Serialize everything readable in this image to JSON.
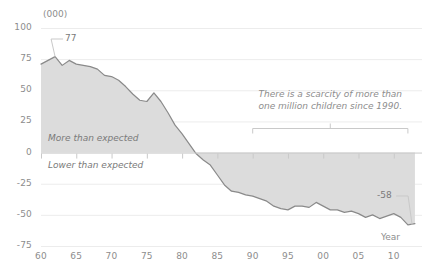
{
  "chart_data": {
    "type": "area",
    "title": "",
    "subtitle": "",
    "unit_label": "(000)",
    "xlabel": "Year",
    "ylabel": "",
    "xlim": [
      1960,
      2013
    ],
    "ylim": [
      -75,
      100
    ],
    "grid": true,
    "legend_position": "none",
    "y_ticks": [
      "100",
      "75",
      "50",
      "25",
      "0",
      "-25",
      "-50",
      "-75"
    ],
    "y_tick_values": [
      100,
      75,
      50,
      25,
      0,
      -25,
      -50,
      -75
    ],
    "x_ticks": [
      "60",
      "65",
      "70",
      "75",
      "80",
      "85",
      "90",
      "95",
      "00",
      "05",
      "10"
    ],
    "x_tick_values": [
      1960,
      1965,
      1970,
      1975,
      1980,
      1985,
      1990,
      1995,
      2000,
      2005,
      2010
    ],
    "zone_labels": [
      {
        "text": "More than expected",
        "x": 1961,
        "y": 11
      },
      {
        "text": "Lower than expected",
        "x": 1961,
        "y": -11
      }
    ],
    "annotations": [
      {
        "name": "scarcity-note",
        "text_line1": "There is a scarcity of more than",
        "text_line2": "one million children since 1990.",
        "bracket_start": 1990,
        "bracket_end": 2012
      },
      {
        "name": "peak-label",
        "text": "77",
        "x": 1962,
        "y": 77
      },
      {
        "name": "last-label",
        "text": "-58",
        "x": 2011,
        "y": -58
      }
    ],
    "x": [
      1960,
      1961,
      1962,
      1963,
      1964,
      1965,
      1966,
      1967,
      1968,
      1969,
      1970,
      1971,
      1972,
      1973,
      1974,
      1975,
      1976,
      1977,
      1978,
      1979,
      1980,
      1981,
      1982,
      1983,
      1984,
      1985,
      1986,
      1987,
      1988,
      1989,
      1990,
      1991,
      1992,
      1993,
      1994,
      1995,
      1996,
      1997,
      1998,
      1999,
      2000,
      2001,
      2002,
      2003,
      2004,
      2005,
      2006,
      2007,
      2008,
      2009,
      2010,
      2011,
      2012,
      2013
    ],
    "values": [
      71,
      74,
      77,
      70,
      74,
      71,
      70,
      69,
      67,
      62,
      61,
      58,
      53,
      47,
      42,
      41,
      48,
      41,
      32,
      22,
      15,
      7,
      -1,
      -6,
      -10,
      -18,
      -26,
      -31,
      -32,
      -34,
      -35,
      -37,
      -39,
      -43,
      -45,
      -46,
      -43,
      -43,
      -44,
      -40,
      -43,
      -46,
      -46,
      -48,
      -47,
      -49,
      -52,
      -50,
      -53,
      -51,
      -49,
      -52,
      -58,
      -57
    ],
    "colors": {
      "line": "#8a8a8a",
      "fill": "#dcdcdc",
      "grid": "#ececec",
      "axis": "#c9c9c9",
      "text": "#8d8d8d",
      "background": "#ffffff"
    }
  }
}
